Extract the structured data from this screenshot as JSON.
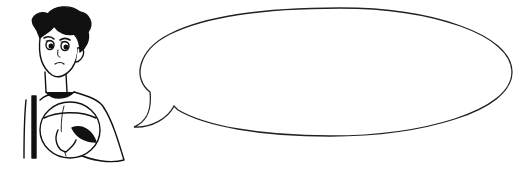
{
  "illustration": {
    "character": {
      "description": "cartoon young man with dark wavy hair, worried expression, holding a ball against chest",
      "expression": "worried"
    },
    "speech_bubble": {
      "text": "",
      "shape": "ellipse-with-tail",
      "tail_direction": "bottom-left"
    },
    "colors": {
      "background": "#ffffff",
      "ink": "#111111"
    }
  }
}
